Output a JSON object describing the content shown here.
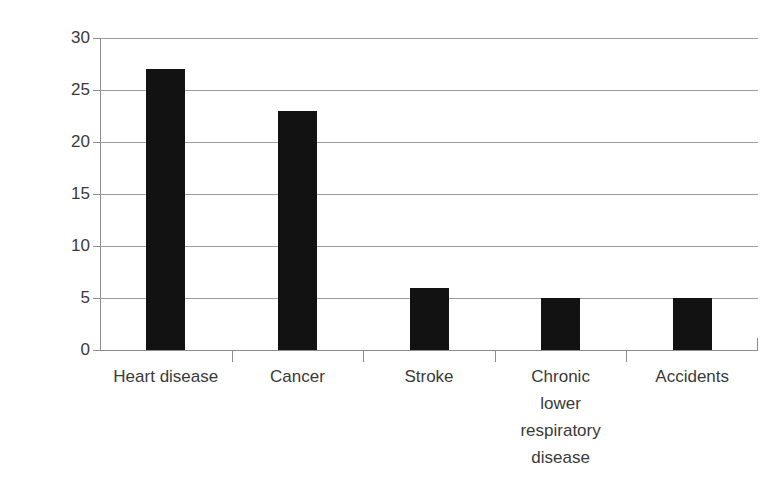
{
  "chart_data": {
    "type": "bar",
    "title": "",
    "subtitle": "",
    "xlabel": "",
    "ylabel": "Percentages",
    "categories": [
      "Heart disease",
      "Cancer",
      "Stroke",
      "Chronic lower respiratory disease",
      "Accidents"
    ],
    "category_label_lines": [
      "Heart disease",
      "Cancer",
      "Stroke",
      "Chronic\nlower\nrespiratory\ndisease",
      "Accidents"
    ],
    "values": [
      27,
      23,
      6,
      5,
      5
    ],
    "ylim": [
      0,
      30
    ],
    "yticks": [
      0,
      5,
      10,
      15,
      20,
      25,
      30
    ],
    "ytick_labels": [
      "0",
      "5",
      "10",
      "15",
      "20",
      "25",
      "30"
    ],
    "grid": true,
    "grid_axis": "y",
    "legend": false,
    "legend_position": "none",
    "bar_color": "#121212",
    "gridline_color": "#9e9e9e",
    "axis_color": "#8c8c8c",
    "background_color": "#ffffff"
  }
}
